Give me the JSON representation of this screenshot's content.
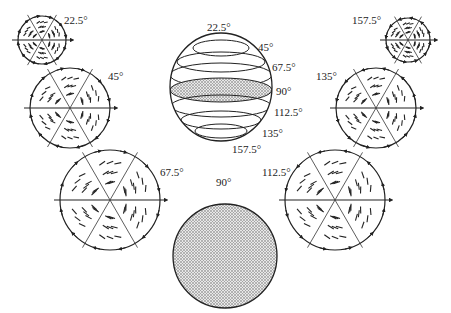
{
  "sphere": {
    "labels": [
      "22.5°",
      "45°",
      "67.5°",
      "90°",
      "112.5°",
      "135°",
      "157.5°"
    ],
    "highlighted": "90°"
  },
  "cross_sections": [
    {
      "angle": "22.5°",
      "cx": 42,
      "cy": 40,
      "r": 24,
      "lx": 64,
      "ly": 22
    },
    {
      "angle": "45°",
      "cx": 70,
      "cy": 108,
      "r": 40,
      "lx": 108,
      "ly": 78
    },
    {
      "angle": "67.5°",
      "cx": 110,
      "cy": 200,
      "r": 50,
      "lx": 156,
      "ly": 175
    },
    {
      "angle": "90°",
      "cx": 225,
      "cy": 256,
      "r": 52,
      "lx": 220,
      "ly": 186
    },
    {
      "angle": "112.5°",
      "cx": 335,
      "cy": 200,
      "r": 50,
      "lx": 264,
      "ly": 175
    },
    {
      "angle": "135°",
      "cx": 376,
      "cy": 108,
      "r": 40,
      "lx": 318,
      "ly": 78
    },
    {
      "angle": "157.5°",
      "cx": 408,
      "cy": 40,
      "r": 22,
      "lx": 353,
      "ly": 22
    }
  ]
}
